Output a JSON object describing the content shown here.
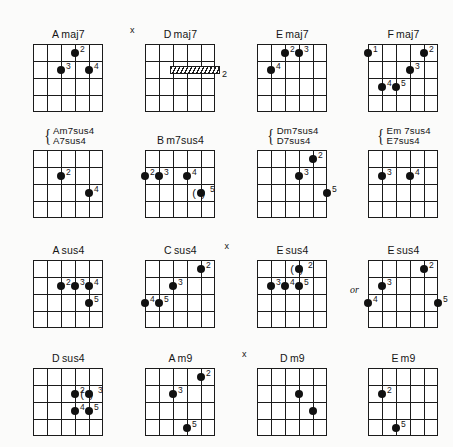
{
  "page": {
    "kind": "guitar-chord-chart",
    "background_color": "#fbfbfa",
    "ink_color": "#151515",
    "or_label": "or",
    "mute_symbol": "x",
    "columns": 4,
    "rows": 4
  },
  "diagrams": [
    {
      "id": "amaj7",
      "name": "Amaj7",
      "title_parts": [
        "A",
        "maj7"
      ],
      "mute": null,
      "strings": 6,
      "frets": 4,
      "dots": [
        {
          "string": 4,
          "fret": 1,
          "finger": "2",
          "paren": false
        },
        {
          "string": 3,
          "fret": 2,
          "finger": "3",
          "paren": false
        },
        {
          "string": 5,
          "fret": 2,
          "finger": "4",
          "paren": false
        }
      ],
      "barre": null
    },
    {
      "id": "dmaj7",
      "name": "Dmaj7",
      "title_parts": [
        "D",
        "maj7"
      ],
      "mute": "x",
      "strings": 6,
      "frets": 4,
      "dots": [],
      "barre": {
        "fret": 2,
        "from_string": 3,
        "to_string": 6,
        "finger": "2"
      }
    },
    {
      "id": "emaj7",
      "name": "Emaj7",
      "title_parts": [
        "E",
        "maj7"
      ],
      "mute": null,
      "strings": 6,
      "frets": 4,
      "dots": [
        {
          "string": 3,
          "fret": 1,
          "finger": "2",
          "paren": false
        },
        {
          "string": 4,
          "fret": 1,
          "finger": "3",
          "paren": false
        },
        {
          "string": 2,
          "fret": 2,
          "finger": "4",
          "paren": false
        }
      ],
      "barre": null
    },
    {
      "id": "fmaj7",
      "name": "Fmaj7",
      "title_parts": [
        "F",
        "maj7"
      ],
      "mute": null,
      "strings": 6,
      "frets": 4,
      "dots": [
        {
          "string": 1,
          "fret": 1,
          "finger": "1",
          "paren": false
        },
        {
          "string": 5,
          "fret": 1,
          "finger": "2",
          "paren": false
        },
        {
          "string": 4,
          "fret": 2,
          "finger": "3",
          "paren": false
        },
        {
          "string": 2,
          "fret": 3,
          "finger": "4",
          "paren": false
        },
        {
          "string": 3,
          "fret": 3,
          "finger": "5",
          "paren": false
        }
      ],
      "barre": null
    },
    {
      "id": "am7sus4",
      "name": "Am7sus4 / A7sus4",
      "title_lines": [
        "Am7sus4",
        "A7sus4"
      ],
      "brace": "{",
      "mute": null,
      "strings": 6,
      "frets": 4,
      "dots": [
        {
          "string": 3,
          "fret": 2,
          "finger": "2",
          "paren": false
        },
        {
          "string": 5,
          "fret": 3,
          "finger": "4",
          "paren": false
        }
      ],
      "barre": null
    },
    {
      "id": "bm7sus4",
      "name": "Bm7sus4",
      "title_parts": [
        "B",
        "m7sus4"
      ],
      "mute": null,
      "strings": 6,
      "frets": 4,
      "dots": [
        {
          "string": 1,
          "fret": 2,
          "finger": "2",
          "paren": false
        },
        {
          "string": 2,
          "fret": 2,
          "finger": "3",
          "paren": false
        },
        {
          "string": 4,
          "fret": 2,
          "finger": "4",
          "paren": false
        },
        {
          "string": 5,
          "fret": 3,
          "finger": "5",
          "paren": true
        }
      ],
      "barre": null
    },
    {
      "id": "dm7sus4",
      "name": "Dm7sus4 / D7sus4",
      "title_lines": [
        "Dm7sus4",
        "D7sus4"
      ],
      "brace": "{",
      "mute": null,
      "strings": 6,
      "frets": 4,
      "dots": [
        {
          "string": 5,
          "fret": 1,
          "finger": "2",
          "paren": false
        },
        {
          "string": 4,
          "fret": 2,
          "finger": "3",
          "paren": false
        },
        {
          "string": 6,
          "fret": 3,
          "finger": "5",
          "paren": false
        }
      ],
      "barre": null
    },
    {
      "id": "em7sus4",
      "name": "Em7sus4 / E7sus4",
      "title_lines": [
        "Em 7sus4",
        "E7sus4"
      ],
      "brace": "{",
      "mute": null,
      "strings": 6,
      "frets": 4,
      "dots": [
        {
          "string": 2,
          "fret": 2,
          "finger": "3",
          "paren": false
        },
        {
          "string": 4,
          "fret": 2,
          "finger": "4",
          "paren": false
        }
      ],
      "barre": null
    },
    {
      "id": "asus4",
      "name": "Asus4",
      "title_parts": [
        "A",
        "sus4"
      ],
      "mute": null,
      "strings": 6,
      "frets": 4,
      "dots": [
        {
          "string": 3,
          "fret": 2,
          "finger": "2",
          "paren": false
        },
        {
          "string": 4,
          "fret": 2,
          "finger": "3",
          "paren": false
        },
        {
          "string": 5,
          "fret": 2,
          "finger": "4",
          "paren": false
        },
        {
          "string": 5,
          "fret": 3,
          "finger": "5",
          "paren": false
        }
      ],
      "barre": null
    },
    {
      "id": "csus4",
      "name": "Csus4",
      "title_parts": [
        "C",
        "sus4"
      ],
      "mute": "x",
      "mute_side": "right",
      "strings": 6,
      "frets": 4,
      "dots": [
        {
          "string": 5,
          "fret": 1,
          "finger": "2",
          "paren": false
        },
        {
          "string": 3,
          "fret": 2,
          "finger": "3",
          "paren": false
        },
        {
          "string": 1,
          "fret": 3,
          "finger": "4",
          "paren": false
        },
        {
          "string": 2,
          "fret": 3,
          "finger": "5",
          "paren": false
        }
      ],
      "barre": null
    },
    {
      "id": "esus4-a",
      "name": "Esus4",
      "title_parts": [
        "E",
        "sus4"
      ],
      "mute": null,
      "strings": 6,
      "frets": 4,
      "dots": [
        {
          "string": 4,
          "fret": 1,
          "finger": "2",
          "paren": true
        },
        {
          "string": 2,
          "fret": 2,
          "finger": "3",
          "paren": false
        },
        {
          "string": 3,
          "fret": 2,
          "finger": "4",
          "paren": false
        },
        {
          "string": 4,
          "fret": 2,
          "finger": "5",
          "paren": false
        }
      ],
      "barre": null,
      "alt_marker": "or"
    },
    {
      "id": "esus4-b",
      "name": "Esus4",
      "title_parts": [
        "E",
        "sus4"
      ],
      "mute": null,
      "strings": 6,
      "frets": 4,
      "dots": [
        {
          "string": 5,
          "fret": 1,
          "finger": "2",
          "paren": false
        },
        {
          "string": 2,
          "fret": 2,
          "finger": "3",
          "paren": false
        },
        {
          "string": 1,
          "fret": 3,
          "finger": "4",
          "paren": false
        },
        {
          "string": 6,
          "fret": 3,
          "finger": "5",
          "paren": false
        }
      ],
      "barre": null
    },
    {
      "id": "dsus4",
      "name": "Dsus4",
      "title_parts": [
        "D",
        "sus4"
      ],
      "mute": null,
      "strings": 6,
      "frets": 4,
      "dots": [
        {
          "string": 4,
          "fret": 2,
          "finger": "2",
          "paren": false
        },
        {
          "string": 5,
          "fret": 2,
          "finger": "3",
          "paren": true
        },
        {
          "string": 4,
          "fret": 3,
          "finger": "4",
          "paren": false
        },
        {
          "string": 5,
          "fret": 3,
          "finger": "5",
          "paren": false
        }
      ],
      "barre": null
    },
    {
      "id": "am9",
      "name": "Am9",
      "title_parts": [
        "A",
        "m9"
      ],
      "mute": null,
      "strings": 6,
      "frets": 4,
      "dots": [
        {
          "string": 5,
          "fret": 1,
          "finger": "2",
          "paren": false
        },
        {
          "string": 3,
          "fret": 2,
          "finger": "3",
          "paren": false
        },
        {
          "string": 4,
          "fret": 4,
          "finger": "5",
          "paren": false
        }
      ],
      "barre": null
    },
    {
      "id": "dm9",
      "name": "Dm9",
      "title_parts": [
        "D",
        "m9"
      ],
      "mute": "x",
      "strings": 6,
      "frets": 4,
      "dots": [
        {
          "string": 4,
          "fret": 2,
          "finger": "",
          "paren": false
        },
        {
          "string": 5,
          "fret": 3,
          "finger": "",
          "paren": false
        }
      ],
      "barre": null
    },
    {
      "id": "em9",
      "name": "Em9",
      "title_parts": [
        "E",
        "m9"
      ],
      "mute": null,
      "strings": 6,
      "frets": 4,
      "dots": [
        {
          "string": 2,
          "fret": 2,
          "finger": "2",
          "paren": false
        },
        {
          "string": 3,
          "fret": 4,
          "finger": "5",
          "paren": false
        }
      ],
      "barre": null
    }
  ]
}
